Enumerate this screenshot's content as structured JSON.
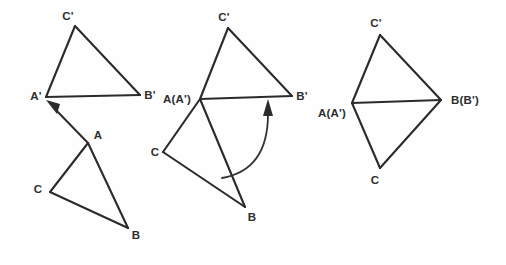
{
  "figure": {
    "background_color": "#fefefe",
    "stroke_color": "#2b2b2b",
    "label_color": "#2e2e2e",
    "width": 506,
    "height": 265,
    "panel_count": 3
  },
  "panels": [
    {
      "id": "panel-translation",
      "caption": "Triangle ABC translated along vector A to A-prime",
      "shapes": [
        {
          "name": "triangle-a-prime-b-prime-c-prime",
          "points": [
            [
              46,
              97
            ],
            [
              140,
              95
            ],
            [
              75,
              26
            ]
          ],
          "vertex_labels": [
            "A'",
            "B'",
            "C'"
          ]
        },
        {
          "name": "triangle-abc",
          "points": [
            [
              88,
              143
            ],
            [
              128,
              228
            ],
            [
              50,
              192
            ]
          ],
          "vertex_labels": [
            "A",
            "B",
            "C"
          ]
        }
      ],
      "vector": {
        "name": "translation-vector",
        "from": [
          88,
          143
        ],
        "to": [
          49,
          103
        ],
        "label": ""
      },
      "labels": [
        {
          "text": "C'",
          "x": 68,
          "y": 20,
          "anchor": "middle"
        },
        {
          "text": "A'",
          "x": 36,
          "y": 100,
          "anchor": "middle"
        },
        {
          "text": "B'",
          "x": 150,
          "y": 99,
          "anchor": "middle"
        },
        {
          "text": "A",
          "x": 98,
          "y": 139,
          "anchor": "middle"
        },
        {
          "text": "C",
          "x": 38,
          "y": 193,
          "anchor": "middle"
        },
        {
          "text": "B",
          "x": 136,
          "y": 239,
          "anchor": "middle"
        }
      ]
    },
    {
      "id": "panel-rotation",
      "caption": "Triangle ABC rotated about A(A') until B meets B'",
      "shapes": [
        {
          "name": "triangle-a-prime-b-prime-c-prime",
          "points": [
            [
              200,
              99
            ],
            [
              292,
              96
            ],
            [
              228,
              28
            ]
          ],
          "vertex_labels": [
            "A(A')",
            "B'",
            "C'"
          ]
        },
        {
          "name": "triangle-abc",
          "points": [
            [
              200,
              99
            ],
            [
              245,
              207
            ],
            [
              163,
              152
            ]
          ],
          "vertex_labels": [
            "A(A')",
            "B",
            "C"
          ]
        }
      ],
      "arc": {
        "name": "rotation-arc",
        "path": "M 222 178 Q 268 168 268 113",
        "arrow_tip": [
          268,
          101
        ],
        "arrow_direction": "up"
      },
      "labels": [
        {
          "text": "C'",
          "x": 224,
          "y": 21,
          "anchor": "middle"
        },
        {
          "text": "A(A')",
          "x": 189,
          "y": 103,
          "anchor": "end"
        },
        {
          "text": "B'",
          "x": 302,
          "y": 100,
          "anchor": "middle"
        },
        {
          "text": "C",
          "x": 155,
          "y": 156,
          "anchor": "middle"
        },
        {
          "text": "B",
          "x": 252,
          "y": 221,
          "anchor": "middle"
        }
      ]
    },
    {
      "id": "panel-result",
      "caption": "Triangles coincide: A with A-prime and B with B-prime",
      "shapes": [
        {
          "name": "triangle-a-prime-b-prime-c-prime",
          "points": [
            [
              352,
              103
            ],
            [
              441,
              100
            ],
            [
              380,
              35
            ]
          ],
          "vertex_labels": [
            "A(A')",
            "B(B')",
            "C'"
          ]
        },
        {
          "name": "triangle-abc",
          "points": [
            [
              352,
              103
            ],
            [
              441,
              100
            ],
            [
              380,
              168
            ]
          ],
          "vertex_labels": [
            "A(A')",
            "B(B')",
            "C"
          ]
        }
      ],
      "labels": [
        {
          "text": "C'",
          "x": 376,
          "y": 27,
          "anchor": "middle"
        },
        {
          "text": "A(A')",
          "x": 344,
          "y": 115,
          "anchor": "end"
        },
        {
          "text": "B(B')",
          "x": 453,
          "y": 104,
          "anchor": "start"
        },
        {
          "text": "C",
          "x": 375,
          "y": 184,
          "anchor": "middle"
        }
      ]
    }
  ]
}
